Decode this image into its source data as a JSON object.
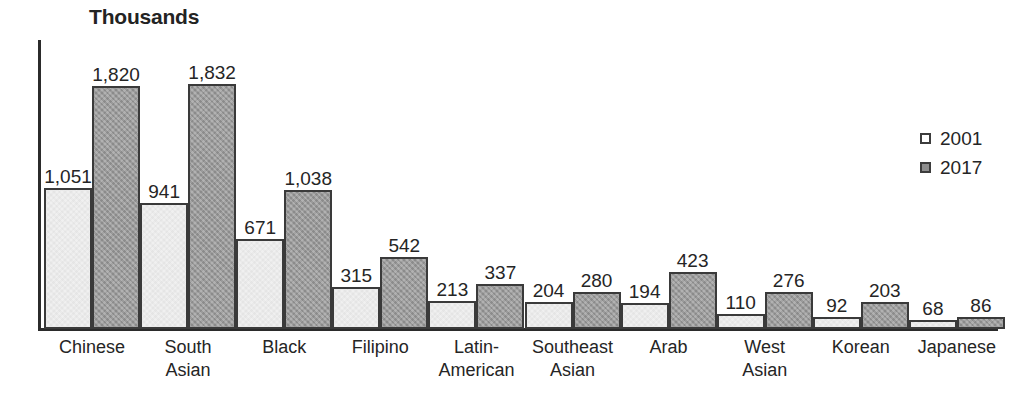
{
  "chart_data": {
    "type": "bar",
    "title": "Thousands",
    "xlabel": "",
    "ylabel": "Thousands",
    "ylim": [
      0,
      1832
    ],
    "grid": false,
    "legend_position": "right",
    "categories": [
      "Chinese",
      "South\nAsian",
      "Black",
      "Filipino",
      "Latin-\nAmerican",
      "Southeast\nAsian",
      "Arab",
      "West\nAsian",
      "Korean",
      "Japanese"
    ],
    "series": [
      {
        "name": "2001",
        "color": "#f0f0f0",
        "values": [
          1051,
          941,
          671,
          315,
          213,
          204,
          194,
          110,
          92,
          68
        ],
        "labels": [
          "1,051",
          "941",
          "671",
          "315",
          "213",
          "204",
          "194",
          "110",
          "92",
          "68"
        ]
      },
      {
        "name": "2017",
        "color": "#989898",
        "values": [
          1820,
          1832,
          1038,
          542,
          337,
          280,
          423,
          276,
          203,
          86
        ],
        "labels": [
          "1,820",
          "1,832",
          "1,038",
          "542",
          "337",
          "280",
          "423",
          "276",
          "203",
          "86"
        ]
      }
    ]
  },
  "legend": {
    "entries": [
      {
        "label": "2001"
      },
      {
        "label": "2017"
      }
    ]
  },
  "colors": {
    "series_2001": "#f0f0f0",
    "series_2017": "#989898",
    "axis": "#2b2b2b",
    "text": "#252525",
    "background": "#ffffff"
  }
}
